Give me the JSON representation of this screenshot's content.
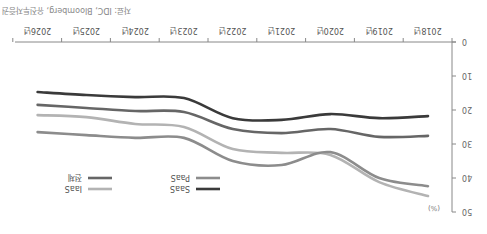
{
  "chart_data": {
    "type": "line",
    "title": "",
    "xlabel": "",
    "ylabel": "(%)",
    "ylim": [
      0,
      50
    ],
    "yticks": [
      0,
      10,
      20,
      30,
      40,
      50
    ],
    "y_inverted": true,
    "grid": false,
    "legend_position": "top-left",
    "categories": [
      "2018년",
      "2019년",
      "2020년",
      "2021년",
      "2022년",
      "2023년",
      "2024년",
      "2025년",
      "2026년"
    ],
    "series": [
      {
        "name": "SaaS",
        "color": "#3a3a3a",
        "values": [
          21.8,
          22.4,
          21.2,
          22.9,
          22.4,
          16.5,
          16.2,
          15.6,
          14.7
        ]
      },
      {
        "name": "PaaS",
        "color": "#8c8c8c",
        "values": [
          42.4,
          40.0,
          32.4,
          36.2,
          35.0,
          28.2,
          28.2,
          27.4,
          26.5
        ]
      },
      {
        "name": "전체",
        "color": "#666666",
        "values": [
          27.6,
          27.9,
          25.6,
          26.8,
          25.6,
          20.6,
          20.3,
          19.4,
          18.5
        ]
      },
      {
        "name": "IaaS",
        "color": "#b3b3b3",
        "values": [
          45.3,
          41.2,
          33.2,
          32.6,
          31.5,
          25.0,
          24.1,
          22.1,
          21.5
        ]
      }
    ],
    "source": "자료: IDC, Bloomberg, 유진투자증권"
  },
  "labels": {
    "unit": "(%)",
    "source": "자료: IDC, Bloomberg, 유진투자증권"
  },
  "legend": [
    {
      "name": "SaaS",
      "color": "#3a3a3a"
    },
    {
      "name": "PaaS",
      "color": "#8c8c8c"
    },
    {
      "name": "전체",
      "color": "#666666"
    },
    {
      "name": "IaaS",
      "color": "#b3b3b3"
    }
  ]
}
